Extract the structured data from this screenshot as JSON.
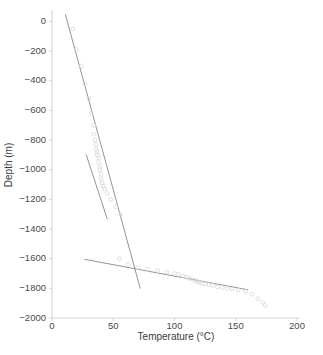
{
  "chart_data": {
    "type": "scatter",
    "title": "",
    "xlabel": "Temperature (°C)",
    "ylabel": "Depth (m)",
    "xlim": [
      0,
      200
    ],
    "ylim": [
      -2000,
      50
    ],
    "grid": false,
    "legend": null,
    "xticks": [
      0,
      50,
      100,
      150,
      200
    ],
    "xticklabels": [
      "0",
      "50",
      "100",
      "150",
      "200"
    ],
    "yticks": [
      0,
      -200,
      -400,
      -600,
      -800,
      -1000,
      -1200,
      -1400,
      -1600,
      -1800,
      -2000
    ],
    "yticklabels": [
      "0",
      "−200",
      "−400",
      "−600",
      "−800",
      "−1000",
      "−1200",
      "−1400",
      "−1600",
      "−1800",
      "−2000"
    ],
    "marker": "open-circle",
    "marker_color": "#d8d8d8",
    "line_color": "#6f6f6f",
    "axis_color": "#bdbdbd",
    "text_color": "#4a4a4a",
    "series": [
      {
        "name": "temperature-depth-profile",
        "x": [
          17,
          20,
          24,
          27,
          30,
          32,
          34,
          34,
          35,
          36,
          36,
          37,
          37,
          38,
          38,
          39,
          39,
          40,
          40,
          41,
          42,
          43,
          45,
          48,
          52,
          56,
          55,
          62,
          70,
          78,
          86,
          94,
          100,
          103,
          107,
          110,
          113,
          116,
          118,
          120,
          122,
          125,
          128,
          131,
          135,
          139,
          143,
          147,
          152,
          158,
          163,
          168,
          172,
          174
        ],
        "y": [
          -50,
          -190,
          -300,
          -420,
          -520,
          -620,
          -700,
          -760,
          -800,
          -830,
          -860,
          -880,
          -900,
          -920,
          -950,
          -980,
          -1000,
          -1030,
          -1060,
          -1090,
          -1110,
          -1130,
          -1160,
          -1200,
          -1250,
          -1300,
          -1600,
          -1640,
          -1660,
          -1670,
          -1680,
          -1690,
          -1700,
          -1705,
          -1715,
          -1725,
          -1735,
          -1745,
          -1750,
          -1760,
          -1765,
          -1770,
          -1775,
          -1780,
          -1790,
          -1795,
          -1800,
          -1805,
          -1810,
          -1820,
          -1840,
          -1870,
          -1895,
          -1915
        ]
      }
    ],
    "trend_lines": [
      {
        "name": "upper-gradient-line",
        "x0": 11,
        "y0": 45,
        "x1": 72,
        "y1": -1800
      },
      {
        "name": "mid-gradient-line",
        "x0": 28,
        "y0": -900,
        "x1": 45,
        "y1": -1330
      },
      {
        "name": "lower-gradient-line",
        "x0": 27,
        "y0": -1605,
        "x1": 160,
        "y1": -1810
      }
    ]
  }
}
